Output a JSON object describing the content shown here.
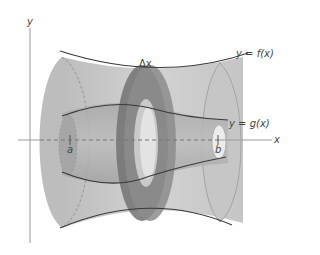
{
  "figure": {
    "type": "solid-of-revolution-washer-method",
    "labels": {
      "y_axis": "y",
      "x_axis": "x",
      "outer_curve": "y = f(x)",
      "inner_curve": "y = g(x)",
      "delta_x": "Δx",
      "left_bound": "a",
      "right_bound": "b"
    },
    "colors": {
      "outer_solid": "#c4c4c4",
      "outer_solid_dark": "#a8a8a8",
      "inner_solid": "#b0b0b0",
      "washer_ring": "#7a7a7a",
      "washer_ring_dark": "#5e5e5e",
      "curve_line": "#3a3a3a",
      "axis_line": "#9a9a9a",
      "dashed_axis": "#777777"
    }
  }
}
